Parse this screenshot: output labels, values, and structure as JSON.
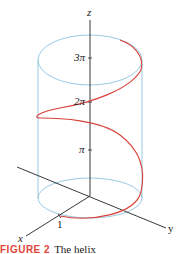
{
  "figure": {
    "axes": {
      "x_label": "x",
      "y_label": "y",
      "z_label": "z"
    },
    "ticks": {
      "one": "1",
      "pi": "π",
      "two_pi": "2π",
      "three_pi": "3π"
    },
    "colors": {
      "helix": "#d9413a",
      "cylinder": "#8fc3dd",
      "axes": "#222222",
      "caption_accent": "#e0463a"
    },
    "caption": {
      "number": "FIGURE 2",
      "text": "The helix"
    }
  }
}
